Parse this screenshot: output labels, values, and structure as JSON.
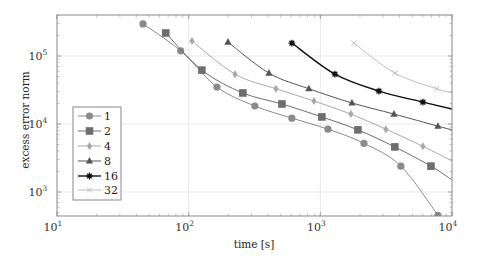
{
  "chart_data": {
    "type": "line",
    "title": "",
    "xlabel": "time [s]",
    "ylabel": "excess error norm",
    "xscale": "log",
    "yscale": "log",
    "xlim": [
      10,
      10000
    ],
    "ylim": [
      430,
      400000
    ],
    "grid": "major",
    "legend_position": "lower left",
    "x_ticks": [
      {
        "value": 10,
        "base": "10",
        "exp": "1"
      },
      {
        "value": 100,
        "base": "10",
        "exp": "2"
      },
      {
        "value": 1000,
        "base": "10",
        "exp": "3"
      },
      {
        "value": 10000,
        "base": "10",
        "exp": "4"
      }
    ],
    "y_ticks": [
      {
        "value": 1000,
        "base": "10",
        "exp": "3"
      },
      {
        "value": 10000,
        "base": "10",
        "exp": "4"
      },
      {
        "value": 100000,
        "base": "10",
        "exp": "5"
      }
    ],
    "series": [
      {
        "name": "1",
        "marker": "circle",
        "color": "#8a8a8a",
        "width": 1.0,
        "x": [
          45,
          87,
          164,
          318,
          608,
          1142,
          2145,
          4090,
          7820
        ],
        "y": [
          296000,
          119000,
          35000,
          18400,
          12200,
          8400,
          5200,
          2400,
          455
        ],
        "extend_to": null
      },
      {
        "name": "2",
        "marker": "square",
        "color": "#6e6e6e",
        "width": 1.0,
        "x": [
          67,
          126,
          258,
          511,
          1027,
          1929,
          3680,
          6920
        ],
        "y": [
          218000,
          62000,
          28600,
          19700,
          12700,
          8200,
          4600,
          2400
        ],
        "extend_to": {
          "x": 10000,
          "y": 1500
        }
      },
      {
        "name": "4",
        "marker": "diamond",
        "color": "#a8a8a8",
        "width": 1.0,
        "x": [
          106,
          225,
          460,
          894,
          1706,
          3145,
          6010
        ],
        "y": [
          166000,
          54000,
          33000,
          21800,
          14000,
          8400,
          4700
        ],
        "extend_to": {
          "x": 10000,
          "y": 2860
        }
      },
      {
        "name": "8",
        "marker": "triangle",
        "color": "#555555",
        "width": 1.0,
        "x": [
          199,
          407,
          818,
          1738,
          3625,
          7820
        ],
        "y": [
          160000,
          56000,
          33000,
          20400,
          14000,
          9300
        ],
        "extend_to": {
          "x": 10000,
          "y": 8200
        }
      },
      {
        "name": "16",
        "marker": "star",
        "color": "#111111",
        "width": 1.4,
        "x": [
          608,
          1290,
          2785,
          6010
        ],
        "y": [
          155000,
          54000,
          30500,
          21000
        ],
        "extend_to": {
          "x": 10000,
          "y": 16600
        }
      },
      {
        "name": "32",
        "marker": "x",
        "color": "#bdbdbd",
        "width": 1.0,
        "x": [
          1800,
          3680,
          7670
        ],
        "y": [
          155000,
          56000,
          33000
        ],
        "extend_to": {
          "x": 10000,
          "y": 28600
        }
      }
    ]
  },
  "legend": {
    "items": [
      "1",
      "2",
      "4",
      "8",
      "16",
      "32"
    ]
  }
}
